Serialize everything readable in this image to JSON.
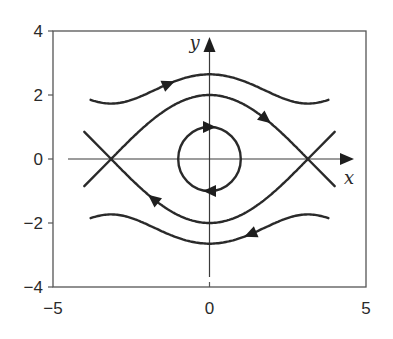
{
  "figure": {
    "system": "dx/dt = y, dy/dt = -sin(x)"
  },
  "axes": {
    "x_label": "x",
    "y_label": "y",
    "xlim": [
      -5,
      5
    ],
    "ylim": [
      -4,
      4
    ],
    "x_ticks": [
      {
        "value": -5,
        "label": "−5"
      },
      {
        "value": 0,
        "label": "0"
      },
      {
        "value": 5,
        "label": "5"
      }
    ],
    "y_ticks": [
      {
        "value": 4,
        "label": "4"
      },
      {
        "value": 2,
        "label": "2"
      },
      {
        "value": 0,
        "label": "0"
      },
      {
        "value": -2,
        "label": "−2"
      },
      {
        "value": -4,
        "label": "−4"
      }
    ]
  },
  "layout": {
    "frame_px": {
      "left": 53,
      "top": 31,
      "right": 366,
      "bottom": 287
    }
  },
  "trajectories": [
    {
      "name": "upper-rotation",
      "kind": "energy",
      "energy": 3.5,
      "branch": 1,
      "x_range": [
        -3.8,
        3.8
      ],
      "arrows": [
        {
          "x": -1.3,
          "dir": 1
        }
      ]
    },
    {
      "name": "upper-separatrix",
      "kind": "energy",
      "energy": 2.0,
      "branch": 1,
      "x_range": [
        -3.14159,
        3.14159
      ],
      "arrows": [
        {
          "x": 1.8,
          "dir": 1
        }
      ]
    },
    {
      "name": "lower-separatrix",
      "kind": "energy",
      "energy": 2.0,
      "branch": -1,
      "x_range": [
        -3.14159,
        3.14159
      ],
      "arrows": [
        {
          "x": -1.8,
          "dir": -1
        }
      ]
    },
    {
      "name": "lower-rotation",
      "kind": "energy",
      "energy": 3.5,
      "branch": -1,
      "x_range": [
        -3.8,
        3.8
      ],
      "arrows": [
        {
          "x": 1.3,
          "dir": -1
        }
      ]
    },
    {
      "name": "center-orbit",
      "kind": "orbit",
      "amplitude": 1.0,
      "arrows": [
        {
          "at": "top",
          "dir": 1
        },
        {
          "at": "bottom",
          "dir": -1
        }
      ]
    },
    {
      "name": "left-separatrix-tails",
      "kind": "segments",
      "segments": [
        [
          [
            -4.0,
            0.85
          ],
          [
            -3.14159,
            0
          ]
        ],
        [
          [
            -4.0,
            -0.85
          ],
          [
            -3.14159,
            0
          ]
        ]
      ]
    },
    {
      "name": "right-separatrix-tails",
      "kind": "segments",
      "segments": [
        [
          [
            3.14159,
            0
          ],
          [
            4.0,
            0.85
          ]
        ],
        [
          [
            3.14159,
            0
          ],
          [
            4.0,
            -0.85
          ]
        ]
      ]
    }
  ],
  "equilibria": [
    {
      "type": "saddle",
      "x": -3.14159,
      "y": 0
    },
    {
      "type": "center",
      "x": 0,
      "y": 0
    },
    {
      "type": "saddle",
      "x": 3.14159,
      "y": 0
    }
  ],
  "chart_data": {
    "type": "line",
    "title": "",
    "xlabel": "x",
    "ylabel": "y",
    "xlim": [
      -5,
      5
    ],
    "ylim": [
      -4,
      4
    ],
    "grid": false,
    "legend": null,
    "series": [
      {
        "name": "rotation (upper), E=3.5",
        "x": [
          -3.8,
          -3,
          -2,
          -1,
          0,
          1,
          2,
          3,
          3.8
        ],
        "y": [
          2.33,
          2.27,
          2.38,
          2.53,
          2.55,
          2.53,
          2.38,
          2.27,
          2.33
        ]
      },
      {
        "name": "separatrix (upper)",
        "x": [
          -3.14,
          -2,
          -1,
          0,
          1,
          2,
          3.14
        ],
        "y": [
          0,
          1.68,
          1.76,
          2.0,
          1.76,
          1.68,
          0
        ]
      },
      {
        "name": "separatrix (lower)",
        "x": [
          -3.14,
          -2,
          -1,
          0,
          1,
          2,
          3.14
        ],
        "y": [
          0,
          -1.68,
          -1.76,
          -2.0,
          -1.76,
          -1.68,
          0
        ]
      },
      {
        "name": "rotation (lower), E=3.5",
        "x": [
          -3.8,
          -3,
          -2,
          -1,
          0,
          1,
          2,
          3,
          3.8
        ],
        "y": [
          -2.33,
          -2.27,
          -2.38,
          -2.53,
          -2.55,
          -2.53,
          -2.38,
          -2.27,
          -2.33
        ]
      },
      {
        "name": "closed orbit about origin",
        "x": [
          1,
          0,
          -1,
          0,
          1
        ],
        "y": [
          0,
          1,
          0,
          -1,
          0
        ]
      }
    ],
    "annotations": [
      "saddle at (-π, 0)",
      "center at (0, 0)",
      "saddle at (π, 0)",
      "flow arrows: rightward for y>0, leftward for y<0, clockwise about origin"
    ]
  }
}
